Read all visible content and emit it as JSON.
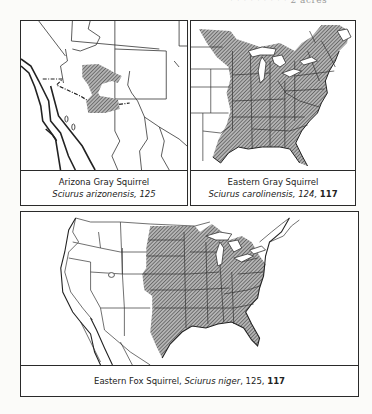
{
  "page_fragment_text": "· · · · · · · · · 2 acres",
  "maps": [
    {
      "id": "arizona-gray-squirrel",
      "common_name": "Arizona Gray Squirrel",
      "scientific_name": "Sciurus arizonensis",
      "page_ref": ", 125",
      "bold_ref": ""
    },
    {
      "id": "eastern-gray-squirrel",
      "common_name": "Eastern Gray Squirrel",
      "scientific_name": "Sciurus carolinensis",
      "page_ref": ", 124, ",
      "bold_ref": "117"
    },
    {
      "id": "eastern-fox-squirrel",
      "common_name": "Eastern Fox Squirrel, ",
      "scientific_name": "Sciurus niger",
      "page_ref": ", 125, ",
      "bold_ref": "117"
    }
  ],
  "colors": {
    "border": "#2a2a2a",
    "hatch": "#555555",
    "range_fill": "#9c9c9c",
    "paper": "#ffffff"
  }
}
